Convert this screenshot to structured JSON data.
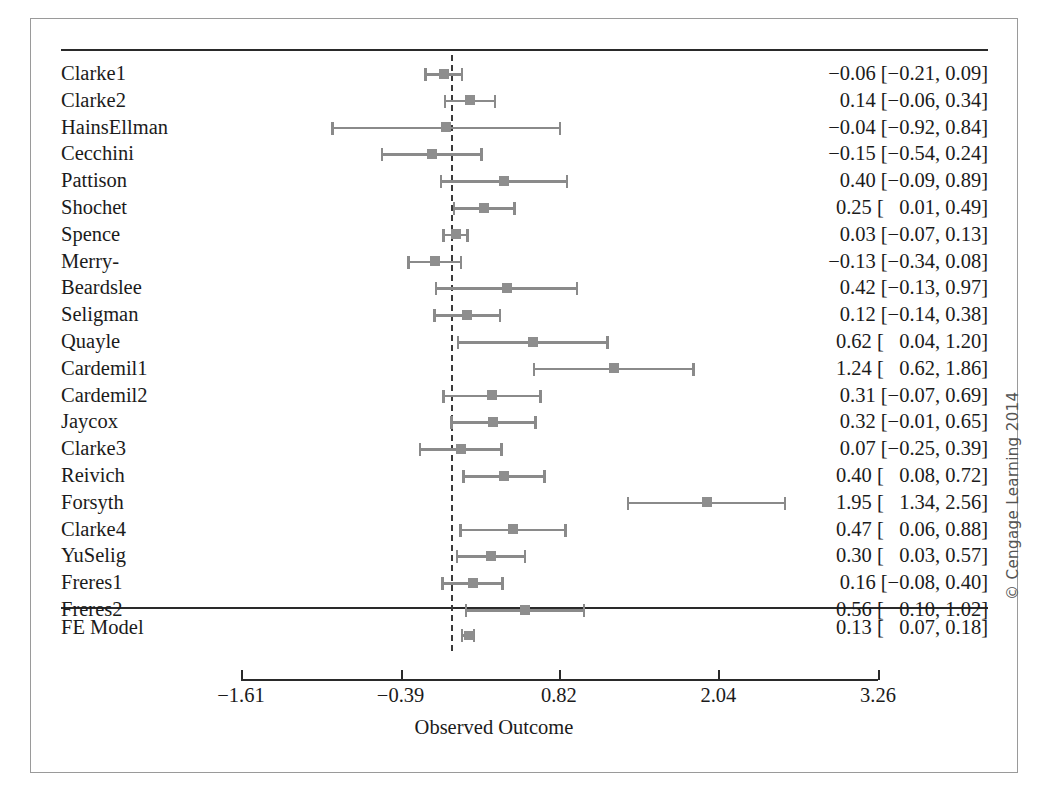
{
  "credit": "© Cengage Learning 2014",
  "axis": {
    "title": "Observed Outcome",
    "ticks": [
      {
        "value": -1.61,
        "label": "−1.61"
      },
      {
        "value": -0.39,
        "label": "−0.39"
      },
      {
        "value": 0.82,
        "label": "0.82"
      },
      {
        "value": 2.04,
        "label": "2.04"
      },
      {
        "value": 3.26,
        "label": "3.26"
      }
    ],
    "reference_line": 0
  },
  "summary_row": {
    "label": "FE Model",
    "estimate_text": "0.13 [   0.07, 0.18]",
    "estimate": 0.13,
    "ci_low": 0.07,
    "ci_high": 0.18
  },
  "chart_data": {
    "type": "forest",
    "title": "",
    "xlabel": "Observed Outcome",
    "ylabel": "",
    "xlim": [
      -1.61,
      3.26
    ],
    "grid": false,
    "reference_line": 0,
    "columns": [
      "Study",
      "Estimate [95% CI]"
    ],
    "studies": [
      {
        "label": "Clarke1",
        "estimate": -0.06,
        "ci_low": -0.21,
        "ci_high": 0.09,
        "text": "−0.06 [−0.21, 0.09]"
      },
      {
        "label": "Clarke2",
        "estimate": 0.14,
        "ci_low": -0.06,
        "ci_high": 0.34,
        "text": "0.14 [−0.06, 0.34]"
      },
      {
        "label": "HainsEllman",
        "estimate": -0.04,
        "ci_low": -0.92,
        "ci_high": 0.84,
        "text": "−0.04 [−0.92, 0.84]"
      },
      {
        "label": "Cecchini",
        "estimate": -0.15,
        "ci_low": -0.54,
        "ci_high": 0.24,
        "text": "−0.15 [−0.54, 0.24]"
      },
      {
        "label": "Pattison",
        "estimate": 0.4,
        "ci_low": -0.09,
        "ci_high": 0.89,
        "text": "0.40 [−0.09, 0.89]"
      },
      {
        "label": "Shochet",
        "estimate": 0.25,
        "ci_low": 0.01,
        "ci_high": 0.49,
        "text": "0.25 [   0.01, 0.49]"
      },
      {
        "label": "Spence",
        "estimate": 0.03,
        "ci_low": -0.07,
        "ci_high": 0.13,
        "text": "0.03 [−0.07, 0.13]"
      },
      {
        "label": "Merry-",
        "estimate": -0.13,
        "ci_low": -0.34,
        "ci_high": 0.08,
        "text": "−0.13 [−0.34, 0.08]"
      },
      {
        "label": "Beardslee",
        "estimate": 0.42,
        "ci_low": -0.13,
        "ci_high": 0.97,
        "text": "0.42 [−0.13, 0.97]"
      },
      {
        "label": "Seligman",
        "estimate": 0.12,
        "ci_low": -0.14,
        "ci_high": 0.38,
        "text": "0.12 [−0.14, 0.38]"
      },
      {
        "label": "Quayle",
        "estimate": 0.62,
        "ci_low": 0.04,
        "ci_high": 1.2,
        "text": "0.62 [   0.04, 1.20]"
      },
      {
        "label": "Cardemil1",
        "estimate": 1.24,
        "ci_low": 0.62,
        "ci_high": 1.86,
        "text": "1.24 [   0.62, 1.86]"
      },
      {
        "label": "Cardemil2",
        "estimate": 0.31,
        "ci_low": -0.07,
        "ci_high": 0.69,
        "text": "0.31 [−0.07, 0.69]"
      },
      {
        "label": "Jaycox",
        "estimate": 0.32,
        "ci_low": -0.01,
        "ci_high": 0.65,
        "text": "0.32 [−0.01, 0.65]"
      },
      {
        "label": "Clarke3",
        "estimate": 0.07,
        "ci_low": -0.25,
        "ci_high": 0.39,
        "text": "0.07 [−0.25, 0.39]"
      },
      {
        "label": "Reivich",
        "estimate": 0.4,
        "ci_low": 0.08,
        "ci_high": 0.72,
        "text": "0.40 [   0.08, 0.72]"
      },
      {
        "label": "Forsyth",
        "estimate": 1.95,
        "ci_low": 1.34,
        "ci_high": 2.56,
        "text": "1.95 [   1.34, 2.56]"
      },
      {
        "label": "Clarke4",
        "estimate": 0.47,
        "ci_low": 0.06,
        "ci_high": 0.88,
        "text": "0.47 [   0.06, 0.88]"
      },
      {
        "label": "YuSelig",
        "estimate": 0.3,
        "ci_low": 0.03,
        "ci_high": 0.57,
        "text": "0.30 [   0.03, 0.57]"
      },
      {
        "label": "Freres1",
        "estimate": 0.16,
        "ci_low": -0.08,
        "ci_high": 0.4,
        "text": "0.16 [−0.08, 0.40]"
      },
      {
        "label": "Freres2",
        "estimate": 0.56,
        "ci_low": 0.1,
        "ci_high": 1.02,
        "text": "0.56 [   0.10, 1.02]"
      }
    ],
    "summary": {
      "label": "FE Model",
      "estimate": 0.13,
      "ci_low": 0.07,
      "ci_high": 0.18,
      "text": "0.13 [   0.07, 0.18]"
    }
  }
}
